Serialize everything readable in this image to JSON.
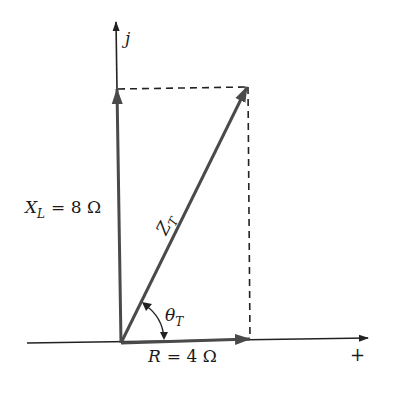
{
  "diagram": {
    "type": "impedance-phasor-diagram",
    "axes": {
      "vertical_label": "j",
      "horizontal_label": "+"
    },
    "vectors": [
      {
        "name": "XL",
        "label_main": "X",
        "label_sub": "L",
        "label_value": "= 8 Ω",
        "direction": "up"
      },
      {
        "name": "R",
        "label_main": "R",
        "label_value": "= 4 Ω",
        "direction": "right"
      },
      {
        "name": "ZT",
        "label_main": "Z",
        "label_sub": "T",
        "direction": "diagonal"
      }
    ],
    "angle": {
      "label_main": "θ",
      "label_sub": "T"
    },
    "colors": {
      "vector": "#4a4a4a",
      "axis": "#222222",
      "dashed": "#222222"
    }
  }
}
